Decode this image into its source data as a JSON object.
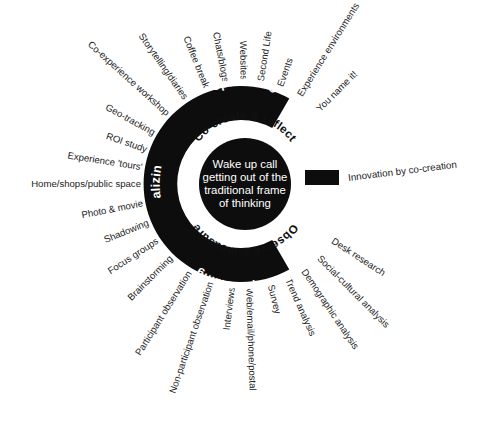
{
  "figure": {
    "center": {
      "x": 245,
      "y": 184
    },
    "core_text_lines": [
      "Wake up call",
      "getting out of the",
      "traditional frame",
      "of thinking"
    ],
    "phases": [
      {
        "name": "optimizing",
        "angle": -62
      },
      {
        "name": "realizing",
        "angle": 180
      },
      {
        "name": "Conceptualizing",
        "angle": 68
      }
    ],
    "inner_ring_labels": [
      {
        "name": "Co-create & reflect",
        "angle": -58
      },
      {
        "name": "Observe & measure",
        "angle": 62
      }
    ],
    "legend": {
      "label": "Innovation by co-creation",
      "color": "#0d0d0d"
    },
    "caption": "",
    "spokes": [
      {
        "label": "Co-experience workshop",
        "angle": -138
      },
      {
        "label": "Storytelling/diaries",
        "angle": -125
      },
      {
        "label": "Coffee break",
        "angle": -112
      },
      {
        "label": "Chats/blogs",
        "angle": -101
      },
      {
        "label": "Websites",
        "angle": -91
      },
      {
        "label": "Second Life",
        "angle": -81
      },
      {
        "label": "Events",
        "angle": -70
      },
      {
        "label": "Experience environments",
        "angle": -58
      },
      {
        "label": "You name it!",
        "angle": -45
      },
      {
        "label": "Geo-tracking",
        "angle": -151
      },
      {
        "label": "ROI study",
        "angle": -161
      },
      {
        "label": "Experience 'tours'",
        "angle": -171
      },
      {
        "label": "Home/shops/public space",
        "angle": 180
      },
      {
        "label": "Photo & movie",
        "angle": 169
      },
      {
        "label": "Shadowing",
        "angle": 158
      },
      {
        "label": "Focus groups",
        "angle": 147
      },
      {
        "label": "Brainstorming",
        "angle": 135
      },
      {
        "label": "Participant observation",
        "angle": 122
      },
      {
        "label": "Non-participant observation",
        "angle": 109
      },
      {
        "label": "Interviews",
        "angle": 97
      },
      {
        "label": "Web/email/phone/postal",
        "angle": 88
      },
      {
        "label": "Survey",
        "angle": 76
      },
      {
        "label": "Trend analysis",
        "angle": 66
      },
      {
        "label": "Demographic analysis",
        "angle": 56
      },
      {
        "label": "Social-cultural analysis",
        "angle": 45
      },
      {
        "label": "Desk research",
        "angle": 33
      }
    ]
  }
}
